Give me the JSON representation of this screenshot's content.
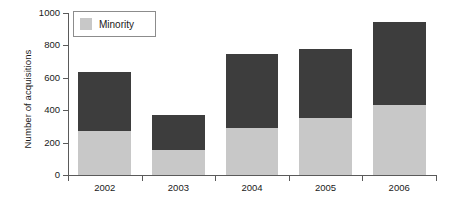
{
  "chart_data": {
    "type": "bar",
    "title": "",
    "subtitle": "",
    "xlabel": "",
    "ylabel": "Number of acquisitions",
    "categories": [
      "2002",
      "2003",
      "2004",
      "2005",
      "2006"
    ],
    "ylim": [
      0,
      1000
    ],
    "yticks": [
      0,
      200,
      400,
      600,
      800,
      1000
    ],
    "ytick_labels": [
      "0",
      "200",
      "400",
      "600",
      "800",
      "1000"
    ],
    "grid": false,
    "stacked": true,
    "legend_position": "top-left-inside",
    "legend": [
      "Minority"
    ],
    "series": [
      {
        "name": "Minority",
        "color": "#c8c8c8",
        "values": [
          270,
          155,
          290,
          350,
          430
        ]
      },
      {
        "name": "Other",
        "color": "#3d3d3d",
        "values": [
          365,
          215,
          460,
          425,
          515
        ]
      }
    ],
    "totals": [
      635,
      370,
      750,
      775,
      945
    ],
    "annotations": []
  },
  "legend": {
    "entries": [
      {
        "label": "Minority",
        "color": "#c8c8c8"
      }
    ]
  },
  "colors": {
    "minority": "#c8c8c8",
    "other": "#3d3d3d",
    "axis": "#5a5a5a",
    "text": "#1a1a1a",
    "background": "#ffffff"
  }
}
